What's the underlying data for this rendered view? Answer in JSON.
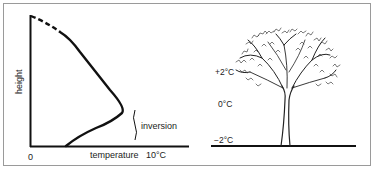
{
  "left_graph": {
    "y_axis_label": "height",
    "x_axis_label": "temperature",
    "x_origin_label": "0",
    "x_max_label": "10°C",
    "annotation": "inversion"
  },
  "right_scene": {
    "labels": [
      "+2°C",
      "0°C",
      "−2°C"
    ],
    "subject": "tree"
  },
  "colors": {
    "ink": "#111111",
    "frame": "#9a9a9a",
    "background": "#ffffff"
  }
}
